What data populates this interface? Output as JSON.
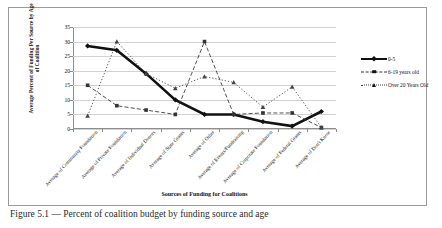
{
  "figure": {
    "caption": "Figure 5.1 — Percent of coalition budget by funding source and age"
  },
  "chart_data": {
    "type": "line",
    "title": "",
    "xlabel": "Sources of Funding for Coalitions",
    "ylabel": "Average Percent of Funding Per Source by Age of Coalition",
    "categories": [
      "Average of Community Foundation",
      "Average of Private Foundation",
      "Average of Individual Donors",
      "Average of State Grants",
      "Average of Other",
      "Average of Events/Fundraising",
      "Average of Corporate Foundation",
      "Average of Federal Grants",
      "Average of Don't Know"
    ],
    "series": [
      {
        "name": "0-5",
        "values": [
          28.5,
          27.0,
          19.0,
          10.0,
          5.0,
          5.0,
          2.5,
          1.0,
          6.0
        ],
        "marker": "diamond",
        "style": "solid-thick",
        "color": "#111111"
      },
      {
        "name": "6-19 years old",
        "values": [
          15.0,
          8.0,
          6.5,
          5.0,
          30.0,
          5.0,
          5.5,
          5.5,
          0.5
        ],
        "marker": "square",
        "style": "dashed",
        "color": "#333333"
      },
      {
        "name": "Over 20 Years Old",
        "values": [
          4.5,
          30.0,
          19.0,
          14.0,
          18.0,
          16.0,
          7.5,
          14.5,
          0.5
        ],
        "marker": "triangle",
        "style": "dotted",
        "color": "#444444"
      }
    ],
    "ylim": [
      0,
      35
    ],
    "yticks": [
      0,
      5,
      10,
      15,
      20,
      25,
      30,
      35
    ],
    "grid": true,
    "legend_position": "right"
  }
}
